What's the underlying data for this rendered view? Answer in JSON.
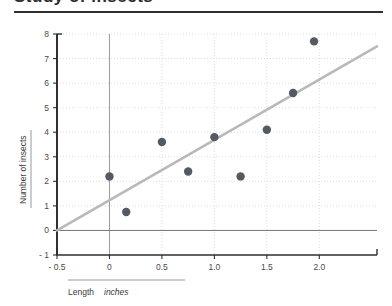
{
  "page": {
    "clipped_heading": "Study of insects",
    "background_color": "#ffffff"
  },
  "chart_data": {
    "type": "scatter",
    "title": "",
    "xlabel": "Length",
    "xlabel_units": "inches",
    "ylabel": "Number of insects",
    "xlim": [
      -0.5,
      2.55
    ],
    "ylim": [
      -1,
      8
    ],
    "xticks": [
      -0.5,
      0,
      0.5,
      1.0,
      1.5,
      2.0
    ],
    "xtick_labels": [
      "- 0.5",
      "0",
      "0.5",
      "1.0",
      "1.5",
      "2.0"
    ],
    "yticks": [
      -1,
      0,
      1,
      2,
      3,
      4,
      5,
      6,
      7,
      8
    ],
    "ytick_labels": [
      "- 1",
      "0",
      "1",
      "2",
      "3",
      "4",
      "5",
      "6",
      "7",
      "8"
    ],
    "grid": true,
    "grid_style": "dotted",
    "legend": "none",
    "point_color": "#545a61",
    "line_color": "#b9b9b9",
    "grid_color": "#d8d8d8",
    "axis_color": "#2f2f2f",
    "points": [
      {
        "x": 0.0,
        "y": 2.2
      },
      {
        "x": 0.16,
        "y": 0.75
      },
      {
        "x": 0.5,
        "y": 3.6
      },
      {
        "x": 0.75,
        "y": 2.4
      },
      {
        "x": 1.0,
        "y": 3.8
      },
      {
        "x": 1.25,
        "y": 2.2
      },
      {
        "x": 1.5,
        "y": 4.1
      },
      {
        "x": 1.75,
        "y": 5.6
      },
      {
        "x": 1.95,
        "y": 7.7
      }
    ],
    "trend_line": {
      "x0": -0.5,
      "y0": 0.0,
      "x1": 2.55,
      "y1": 7.5
    },
    "zero_line_y": 0,
    "zero_line_x": 0
  }
}
